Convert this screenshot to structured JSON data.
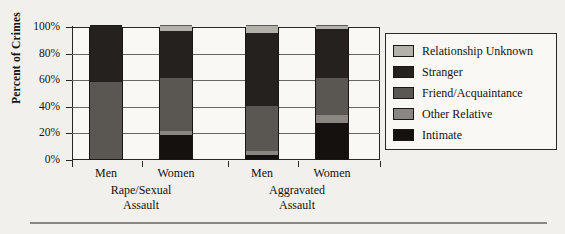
{
  "chart_data": {
    "type": "bar",
    "stacked": true,
    "title": "",
    "xlabel": "",
    "ylabel": "Percent of Crimes",
    "ylim": [
      0,
      100
    ],
    "ytick_labels": [
      "0%",
      "20%",
      "40%",
      "60%",
      "80%",
      "100%"
    ],
    "ytick_values": [
      0,
      20,
      40,
      60,
      80,
      100
    ],
    "grid": true,
    "legend_position": "right",
    "categories": [
      "Men",
      "Women",
      "Men",
      "Women"
    ],
    "groups": [
      {
        "label": "Rape/Sexual\nAssault",
        "line1": "Rape/Sexual",
        "line2": "Assault",
        "categories": [
          "Men",
          "Women"
        ]
      },
      {
        "label": "Aggravated\nAssault",
        "line1": "Aggravated",
        "line2": "Assault",
        "categories": [
          "Men",
          "Women"
        ]
      }
    ],
    "series": [
      {
        "name": "Intimate",
        "color": "#14110f",
        "values": [
          0,
          18,
          3,
          27
        ]
      },
      {
        "name": "Other Relative",
        "color": "#8a8782",
        "values": [
          0,
          3,
          3,
          6
        ]
      },
      {
        "name": "Friend/Acquaintance",
        "color": "#5a5651",
        "values": [
          58,
          40,
          34,
          28
        ]
      },
      {
        "name": "Stranger",
        "color": "#24211e",
        "values": [
          42,
          35,
          55,
          37
        ]
      },
      {
        "name": "Relationship Unknown",
        "color": "#b4b1ab",
        "values": [
          0,
          4,
          5,
          2
        ]
      }
    ],
    "legend_order": [
      "Relationship Unknown",
      "Stranger",
      "Friend/Acquaintance",
      "Other Relative",
      "Intimate"
    ]
  },
  "legend": {
    "items": [
      {
        "label": "Relationship Unknown",
        "color": "#b4b1ab"
      },
      {
        "label": "Stranger",
        "color": "#24211e"
      },
      {
        "label": "Friend/Acquaintance",
        "color": "#5a5651"
      },
      {
        "label": "Other Relative",
        "color": "#8a8782"
      },
      {
        "label": "Intimate",
        "color": "#14110f"
      }
    ]
  },
  "axes": {
    "y_title": "Percent of Crimes",
    "y_ticks": [
      "100%",
      "80%",
      "60%",
      "40%",
      "20%",
      "0%"
    ]
  }
}
